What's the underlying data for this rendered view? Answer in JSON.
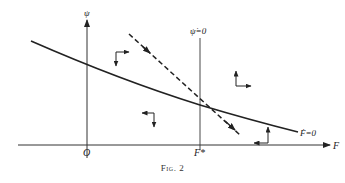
{
  "figure": {
    "caption": "Fig. 2",
    "axes": {
      "y_label": "ψ",
      "x_label": "F",
      "origin_label": "O",
      "equilibrium_label": "F*"
    },
    "curves": {
      "f_dot_zero_label": "Ḟ=0",
      "psi_dot_zero_label": "ψ̇=0"
    },
    "phase_arrows": [
      {
        "region": "upper-left",
        "horizontal": "right",
        "vertical": "down"
      },
      {
        "region": "upper-right",
        "horizontal": "right",
        "vertical": "up"
      },
      {
        "region": "lower-left",
        "horizontal": "left",
        "vertical": "down"
      },
      {
        "region": "lower-right",
        "horizontal": "left",
        "vertical": "up"
      }
    ],
    "colors": {
      "ink": "#222222",
      "background": "#ffffff"
    }
  }
}
